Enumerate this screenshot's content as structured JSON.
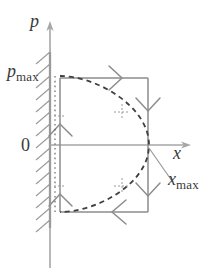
{
  "figure": {
    "background_color": "#ffffff",
    "line_color": "#8c8c8c",
    "dash_color": "#3f3f3f",
    "text_color": "#3a3a3a",
    "hatch_color": "#9a9a9a"
  },
  "axes": {
    "vertical": {
      "name": "p-axis",
      "label_symbol": "p",
      "label_subscript": "",
      "arrow": "up",
      "x": 50,
      "y_top": 22,
      "y_bottom": 268
    },
    "horizontal": {
      "name": "x-axis",
      "label_symbol": "x",
      "label_subscript": "",
      "arrow": "right",
      "y": 145,
      "x_left": 50,
      "x_right": 192
    },
    "origin_label": "0"
  },
  "labels": {
    "p_axis": {
      "symbol": "p",
      "subscript": ""
    },
    "p_max": {
      "symbol": "p",
      "subscript": "max"
    },
    "origin": {
      "text": "0"
    },
    "x_axis": {
      "symbol": "x",
      "subscript": ""
    },
    "x_max": {
      "symbol": "x",
      "subscript": "max"
    }
  },
  "wall": {
    "name": "hatched-wall",
    "x": 50,
    "y_top": 52,
    "y_bottom": 228,
    "hatch_count": 15,
    "hatch_direction": "up-right"
  },
  "rectangle": {
    "name": "cycle-rectangle",
    "left": 60,
    "right": 148,
    "top": 78,
    "bottom": 212,
    "direction_arrows": [
      {
        "name": "top-arrow-right",
        "edge": "top",
        "x": 117,
        "y": 78,
        "dir": "right"
      },
      {
        "name": "right-arrow-down-1",
        "edge": "right",
        "x": 148,
        "y": 108,
        "dir": "down"
      },
      {
        "name": "right-arrow-down-2",
        "edge": "right",
        "x": 148,
        "y": 193,
        "dir": "down"
      },
      {
        "name": "bottom-arrow-left",
        "edge": "bottom",
        "x": 116,
        "y": 212,
        "dir": "left"
      },
      {
        "name": "left-arrow-up-1",
        "edge": "left",
        "x": 60,
        "y": 195,
        "dir": "up"
      },
      {
        "name": "left-arrow-up-2",
        "edge": "left",
        "x": 60,
        "y": 125,
        "dir": "up"
      }
    ]
  },
  "dashed_curve": {
    "name": "elliptical-path",
    "description": "semi-ellipse bulging right from top-left corner to bottom-left corner",
    "start": [
      60,
      76
    ],
    "apex": [
      149,
      145
    ],
    "end": [
      60,
      212
    ],
    "style": "dashed"
  },
  "dashed_vertical": {
    "name": "dotted-left-boundary",
    "x": 55,
    "y_top": 76,
    "y_bottom": 213,
    "style": "dotted"
  },
  "leader_line": {
    "name": "x-max-leader",
    "from": [
      150,
      148
    ],
    "to": [
      172,
      180
    ]
  },
  "tick_marks": [
    {
      "name": "curve-tick-upper",
      "x": 122,
      "y": 110
    },
    {
      "name": "curve-tick-lower",
      "x": 122,
      "y": 184
    },
    {
      "name": "left-tick-upper",
      "x": 59,
      "y": 116
    },
    {
      "name": "left-tick-lower",
      "x": 59,
      "y": 186
    }
  ]
}
